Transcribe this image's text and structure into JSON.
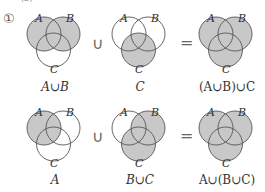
{
  "problem": {
    "number": "①",
    "top_partial": "(2)"
  },
  "colors": {
    "shade": "#c8c8c8",
    "stroke": "#555555"
  },
  "rows": [
    {
      "diagrams": [
        {
          "caption": "A∪B",
          "shaded": "A,B",
          "labels": {
            "a": "A",
            "b": "B",
            "c": "C"
          }
        },
        {
          "caption": "C",
          "shaded": "C",
          "labels": {
            "a": "A",
            "b": "B",
            "c": "C"
          }
        },
        {
          "caption": "(A∪B)∪C",
          "shaded": "A,B,C",
          "labels": {
            "a": "A",
            "b": "B",
            "c": "C"
          }
        }
      ],
      "op1": "∪",
      "op2": "="
    },
    {
      "diagrams": [
        {
          "caption": "A",
          "shaded": "A",
          "labels": {
            "a": "A",
            "b": "B",
            "c": "C"
          }
        },
        {
          "caption": "B∪C",
          "shaded": "B,C",
          "labels": {
            "a": "A",
            "b": "B",
            "c": "C"
          }
        },
        {
          "caption": "A∪(B∪C)",
          "shaded": "A,B,C",
          "labels": {
            "a": "A",
            "b": "B",
            "c": "C"
          }
        }
      ],
      "op1": "∪",
      "op2": "="
    }
  ]
}
